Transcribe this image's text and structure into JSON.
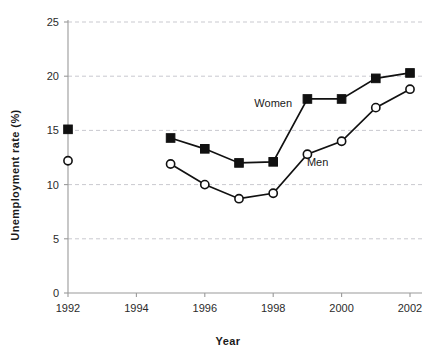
{
  "chart_data": {
    "type": "line",
    "title": "",
    "xlabel": "Year",
    "ylabel": "Unemployment rate (%)",
    "xlim": [
      1992,
      2002
    ],
    "ylim": [
      0,
      25
    ],
    "xticks": [
      1992,
      1994,
      1996,
      1998,
      2000,
      2002
    ],
    "yticks": [
      0,
      5,
      10,
      15,
      20,
      25
    ],
    "xtick_labels": [
      "1992",
      "1994",
      "1996",
      "1998",
      "2000",
      "2002"
    ],
    "ytick_labels": [
      "0",
      "5",
      "10",
      "15",
      "20",
      "25"
    ],
    "grid": "horizontal-dashed",
    "legend": "inline-annotations",
    "series": [
      {
        "name": "Women",
        "marker": "filled-square",
        "x": [
          1992,
          1995,
          1996,
          1997,
          1998,
          1999,
          2000,
          2001,
          2002
        ],
        "values": [
          15.1,
          14.3,
          13.3,
          12.0,
          12.1,
          17.9,
          17.9,
          19.8,
          20.3
        ],
        "segments": [
          [
            1995,
            1996,
            1997,
            1998,
            1999,
            2000,
            2001,
            2002
          ]
        ],
        "isolated_points": [
          1992
        ],
        "label_text": "Women",
        "label_x": 1998.0,
        "label_y": 17.2
      },
      {
        "name": "Men",
        "marker": "open-circle",
        "x": [
          1992,
          1995,
          1996,
          1997,
          1998,
          1999,
          2000,
          2001,
          2002
        ],
        "values": [
          12.2,
          11.9,
          10.0,
          8.7,
          9.2,
          12.8,
          14.0,
          17.1,
          18.8
        ],
        "segments": [
          [
            1995,
            1996,
            1997,
            1998,
            1999,
            2000,
            2001,
            2002
          ]
        ],
        "isolated_points": [
          1992
        ],
        "label_text": "Men",
        "label_x": 1999.3,
        "label_y": 11.7
      }
    ]
  },
  "axes": {
    "y_title": "Unemployment rate (%)",
    "x_title": "Year"
  },
  "annotations": {
    "women_label": "Women",
    "men_label": "Men"
  },
  "colors": {
    "ink": "#111111",
    "grid": "#c9c9cf",
    "axis": "#9a9a9a",
    "background": "#ffffff"
  }
}
